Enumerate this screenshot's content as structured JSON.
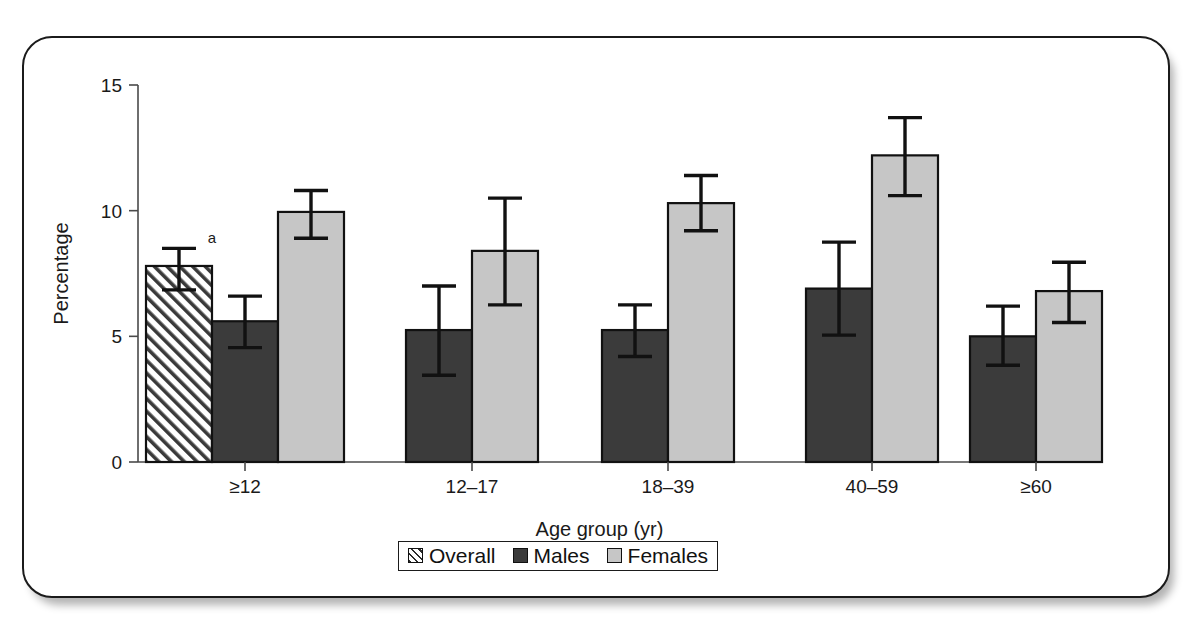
{
  "figure": {
    "y_axis_title": "Percentage",
    "x_axis_title": "Age group (yr)",
    "footnote_marker": "a"
  },
  "legend": {
    "items": [
      {
        "label": "Overall",
        "swatch": "hatched-swatch-icon",
        "color": "#ffffff"
      },
      {
        "label": "Males",
        "swatch": "dark-gray-swatch-icon",
        "color": "#3b3b3b"
      },
      {
        "label": "Females",
        "swatch": "light-gray-swatch-icon",
        "color": "#c6c6c6"
      }
    ]
  },
  "chart_data": {
    "type": "bar",
    "title": "",
    "subtitle": "",
    "xlabel": "Age group (yr)",
    "ylabel": "Percentage",
    "ylim": [
      0,
      15
    ],
    "yticks": [
      "0",
      "5",
      "10",
      "15"
    ],
    "ytick_values": [
      0,
      5,
      10,
      15
    ],
    "grid": false,
    "legend_position": "bottom",
    "categories": [
      "≥12",
      "12–17",
      "18–39",
      "40–59",
      "≥60"
    ],
    "series": [
      {
        "name": "Overall",
        "values": [
          7.8,
          null,
          null,
          null,
          null
        ],
        "err_low": [
          6.85,
          null,
          null,
          null,
          null
        ],
        "err_high": [
          8.5,
          null,
          null,
          null,
          null
        ]
      },
      {
        "name": "Males",
        "values": [
          5.6,
          5.25,
          5.25,
          6.9,
          5.0
        ],
        "err_low": [
          4.55,
          3.45,
          4.2,
          5.05,
          3.85
        ],
        "err_high": [
          6.6,
          7.0,
          6.25,
          8.75,
          6.2
        ]
      },
      {
        "name": "Females",
        "values": [
          9.95,
          8.4,
          10.3,
          12.2,
          6.8
        ],
        "err_low": [
          8.9,
          6.25,
          9.2,
          10.6,
          5.55
        ],
        "err_high": [
          10.8,
          10.5,
          11.4,
          13.7,
          7.95
        ]
      }
    ],
    "annotations": [
      {
        "text": "a",
        "series": "Overall",
        "category": "≥12",
        "note": "footnote marker above Overall bar error bar"
      }
    ]
  }
}
